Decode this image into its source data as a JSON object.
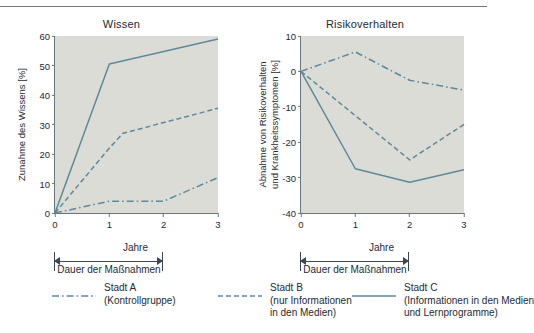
{
  "accent_color": "#5c8a9c",
  "plot_bg": "#dcdcd6",
  "axis_color": "#6a767d",
  "legend": {
    "items": [
      {
        "id": "stadt-a",
        "label": "Stadt A",
        "sub1": "(Kontrollgruppe)",
        "sub2": "",
        "style": "dash-dot"
      },
      {
        "id": "stadt-b",
        "label": "Stadt B",
        "sub1": "(nur Informationen",
        "sub2": "in den Medien)",
        "style": "dashed"
      },
      {
        "id": "stadt-c",
        "label": "Stadt C",
        "sub1": "(Informationen in den Medien",
        "sub2": "und Lernprogramme)",
        "style": "solid"
      }
    ]
  },
  "bracket_label": "Dauer der Maßnahmen",
  "chart_data": [
    {
      "type": "line",
      "id": "wissen",
      "title": "Wissen",
      "xlabel": "Jahre",
      "ylabel": "Zunahme des Wissens [%]",
      "xlim": [
        0,
        3
      ],
      "ylim": [
        0,
        60
      ],
      "xticks": [
        0,
        1,
        2,
        3
      ],
      "yticks": [
        0,
        10,
        20,
        30,
        40,
        50,
        60
      ],
      "grid": false,
      "legend_position": "below-figure",
      "series": [
        {
          "name": "Stadt A",
          "style": "dash-dot",
          "x": [
            0,
            0.25,
            1,
            2,
            3
          ],
          "values": [
            0,
            1,
            4,
            4,
            12
          ]
        },
        {
          "name": "Stadt B",
          "style": "dashed",
          "x": [
            0,
            1,
            1.25,
            3
          ],
          "values": [
            0,
            22,
            27,
            35.5
          ]
        },
        {
          "name": "Stadt C",
          "style": "solid",
          "x": [
            0,
            1,
            3
          ],
          "values": [
            0,
            50.5,
            59
          ]
        }
      ]
    },
    {
      "type": "line",
      "id": "risikoverhalten",
      "title": "Risikoverhalten",
      "xlabel": "Jahre",
      "ylabel": "Abnahme von Risikoverhalten und Krankheitssymptomen [%]",
      "ylabel_line1": "Abnahme von Risikoverhalten",
      "ylabel_line2": "und Krankheitssymptomen [%]",
      "xlim": [
        0,
        3
      ],
      "ylim": [
        -40,
        10
      ],
      "xticks": [
        0,
        1,
        2,
        3
      ],
      "yticks": [
        10,
        0,
        -10,
        -20,
        -30,
        -40
      ],
      "grid": false,
      "legend_position": "below-figure",
      "series": [
        {
          "name": "Stadt A",
          "style": "dash-dot",
          "x": [
            0,
            1,
            2,
            3
          ],
          "values": [
            0,
            5.5,
            -2.5,
            -5.3
          ]
        },
        {
          "name": "Stadt B",
          "style": "dashed",
          "x": [
            0,
            2,
            3
          ],
          "values": [
            0,
            -25,
            -15
          ]
        },
        {
          "name": "Stadt C",
          "style": "solid",
          "x": [
            0,
            1,
            2,
            3
          ],
          "values": [
            0,
            -27.5,
            -31.3,
            -27.8
          ]
        }
      ]
    }
  ]
}
